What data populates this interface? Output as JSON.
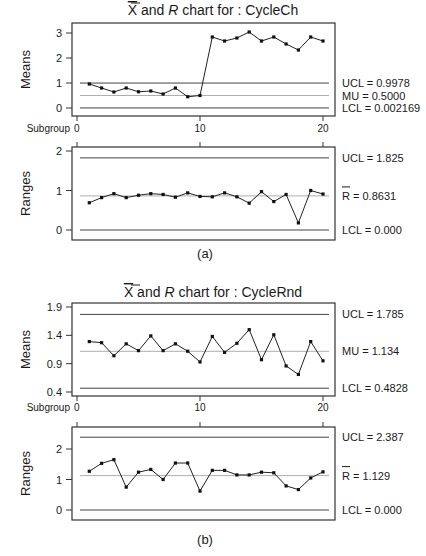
{
  "figures": [
    {
      "id": "a",
      "caption": "(a)",
      "title_prefix": "X",
      "title_mid": " and ",
      "title_r": "R",
      "title_suffix": " chart for : CycleCh",
      "xaxis_label": "Subgroup",
      "means": {
        "ylabel": "Means",
        "yticks": [
          "3",
          "2",
          "1",
          "0"
        ],
        "limits": {
          "ucl": "UCL = 0.9978",
          "center": "MU = 0.5000",
          "lcl": "LCL = 0.002169"
        }
      },
      "ranges": {
        "ylabel": "Ranges",
        "yticks": [
          "2",
          "1",
          "0"
        ],
        "limits": {
          "ucl": "UCL = 1.825",
          "center_prefix": "R",
          "center": " = 0.8631",
          "lcl": "LCL = 0.000"
        }
      },
      "xticks": [
        "0",
        "10",
        "20"
      ]
    },
    {
      "id": "b",
      "caption": "(b)",
      "title_prefix": "X",
      "title_mid": " and ",
      "title_r": "R",
      "title_suffix": " chart for : CycleRnd",
      "xaxis_label": "Subgroup",
      "means": {
        "ylabel": "Means",
        "yticks": [
          "1.9",
          "1.4",
          "0.9",
          "0.4"
        ],
        "limits": {
          "ucl": "UCL = 1.785",
          "center": "MU = 1.134",
          "lcl": "LCL = 0.4828"
        }
      },
      "ranges": {
        "ylabel": "Ranges",
        "yticks": [
          "2",
          "1",
          "0"
        ],
        "limits": {
          "ucl": "UCL = 2.387",
          "center_prefix": "R",
          "center": " = 1.129",
          "lcl": "LCL = 0.000"
        }
      },
      "xticks": [
        "0",
        "10",
        "20"
      ]
    }
  ],
  "chart_data": [
    {
      "type": "line",
      "title": "X-bar chart for : CycleCh (a)",
      "xlabel": "Subgroup",
      "ylabel": "Means",
      "x": [
        1,
        2,
        3,
        4,
        5,
        6,
        7,
        8,
        9,
        10,
        11,
        12,
        13,
        14,
        15,
        16,
        17,
        18,
        19,
        20
      ],
      "values": [
        0.96,
        0.8,
        0.64,
        0.8,
        0.65,
        0.68,
        0.56,
        0.8,
        0.45,
        0.5,
        2.84,
        2.68,
        2.8,
        3.04,
        2.68,
        2.84,
        2.56,
        2.32,
        2.84,
        2.68
      ],
      "ylim": [
        -0.3,
        3.4
      ],
      "yticks": [
        0,
        1,
        2,
        3
      ],
      "control_lines": {
        "UCL": 0.9978,
        "MU": 0.5,
        "LCL": 0.002169
      }
    },
    {
      "type": "line",
      "title": "R chart for : CycleCh (a)",
      "xlabel": "Subgroup",
      "ylabel": "Ranges",
      "x": [
        1,
        2,
        3,
        4,
        5,
        6,
        7,
        8,
        9,
        10,
        11,
        12,
        13,
        14,
        15,
        16,
        17,
        18,
        19,
        20
      ],
      "values": [
        0.69,
        0.82,
        0.92,
        0.82,
        0.88,
        0.92,
        0.9,
        0.83,
        0.94,
        0.85,
        0.84,
        0.94,
        0.84,
        0.68,
        0.97,
        0.72,
        0.9,
        0.18,
        1.0,
        0.91
      ],
      "ylim": [
        -0.25,
        2.1
      ],
      "yticks": [
        0,
        1,
        2
      ],
      "control_lines": {
        "UCL": 1.825,
        "R_bar": 0.8631,
        "LCL": 0.0
      }
    },
    {
      "type": "line",
      "title": "X-bar chart for : CycleRnd (b)",
      "xlabel": "Subgroup",
      "ylabel": "Means",
      "x": [
        1,
        2,
        3,
        4,
        5,
        6,
        7,
        8,
        9,
        10,
        11,
        12,
        13,
        14,
        15,
        16,
        17,
        18,
        19,
        20
      ],
      "values": [
        1.29,
        1.27,
        1.04,
        1.25,
        1.13,
        1.39,
        1.13,
        1.25,
        1.12,
        0.93,
        1.38,
        1.1,
        1.26,
        1.5,
        0.97,
        1.41,
        0.86,
        0.71,
        1.29,
        0.95
      ],
      "ylim": [
        0.33,
        1.96
      ],
      "yticks": [
        0.4,
        0.9,
        1.4,
        1.9
      ],
      "control_lines": {
        "UCL": 1.785,
        "MU": 1.134,
        "LCL": 0.4828
      }
    },
    {
      "type": "line",
      "title": "R chart for : CycleRnd (b)",
      "xlabel": "Subgroup",
      "ylabel": "Ranges",
      "x": [
        1,
        2,
        3,
        4,
        5,
        6,
        7,
        8,
        9,
        10,
        11,
        12,
        13,
        14,
        15,
        16,
        17,
        18,
        19,
        20
      ],
      "values": [
        1.27,
        1.53,
        1.65,
        0.75,
        1.24,
        1.33,
        1.0,
        1.54,
        1.54,
        0.62,
        1.3,
        1.3,
        1.15,
        1.15,
        1.24,
        1.22,
        0.79,
        0.67,
        1.05,
        1.25
      ],
      "ylim": [
        -0.3,
        2.7
      ],
      "yticks": [
        0,
        1,
        2
      ],
      "control_lines": {
        "UCL": 2.387,
        "R_bar": 1.129,
        "LCL": 0.0
      }
    }
  ]
}
